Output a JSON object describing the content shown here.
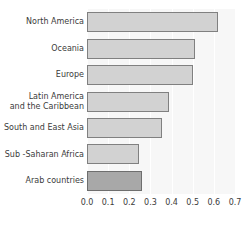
{
  "chart_data": {
    "type": "bar",
    "orientation": "horizontal",
    "title": "",
    "xlabel": "",
    "ylabel": "",
    "categories": [
      "North America",
      "Oceania",
      "Europe",
      "Latin America\nand the Caribbean",
      "South and East Asia",
      "Sub -Saharan Africa",
      "Arab countries"
    ],
    "values": [
      0.62,
      0.51,
      0.5,
      0.39,
      0.355,
      0.245,
      0.26
    ],
    "xlim": [
      0.0,
      0.7
    ],
    "xticks": [
      "0.0",
      "0.1",
      "0.2",
      "0.3",
      "0.4",
      "0.5",
      "0.6",
      "0.7"
    ],
    "xtick_values": [
      0.0,
      0.1,
      0.2,
      0.3,
      0.4,
      0.5,
      0.6,
      0.7
    ],
    "grid": true,
    "grid_axis": "x",
    "legend": "none",
    "highlight_category": "Arab countries",
    "colors": {
      "bar_fill": "#d2d2d2",
      "bar_stroke": "#808080",
      "highlight_fill": "#a8a8a8",
      "highlight_stroke": "#6e6e6e",
      "plot_background": "#f7f7f7",
      "gridline": "#ffffff",
      "text": "#3b3b3b"
    }
  }
}
